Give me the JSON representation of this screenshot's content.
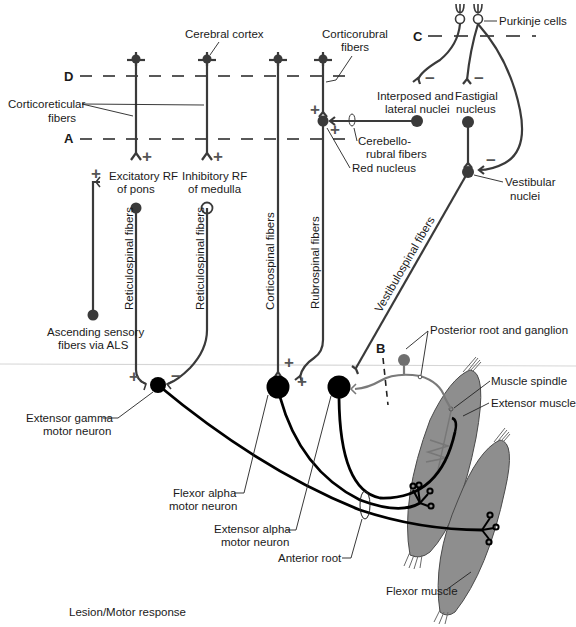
{
  "figure": {
    "colors": {
      "fiber": "#3a3a3a",
      "afferent_fiber": "#7a7a7a",
      "motor_axon": "#000000",
      "muscle_fill": "#8e8e8e",
      "ganglion_fill": "#6f6f6f",
      "divider_line": "#d6d6d6"
    },
    "lesion_levels": {
      "A": "A",
      "B": "B",
      "C": "C",
      "D": "D"
    },
    "labels": {
      "cerebral_cortex": "Cerebral cortex",
      "corticorubral_1": "Corticorubral",
      "corticorubral_2": "fibers",
      "purkinje": "Purkinje cells",
      "corticoreticular_1": "Corticoreticular",
      "corticoreticular_2": "fibers",
      "interposed_1": "Interposed and",
      "interposed_2": "lateral nuclei",
      "fastigial_1": "Fastigial",
      "fastigial_2": "nucleus",
      "cerebellorubral_1": "Cerebello-",
      "cerebellorubral_2": "rubral fibers",
      "red_nucleus": "Red nucleus",
      "excitatory_rf_1": "Excitatory RF",
      "excitatory_rf_2": "of pons",
      "inhibitory_rf_1": "Inhibitory RF",
      "inhibitory_rf_2": "of medulla",
      "vestibular_1": "Vestibular",
      "vestibular_2": "nuclei",
      "reticulospinal_1": "Reticulospinal fibers",
      "reticulospinal_2": "Reticulospinal fibers",
      "corticospinal": "Corticospinal fibers",
      "rubrospinal": "Rubrospinal fibers",
      "vestibulospinal": "Vestibulospinal fibers",
      "ascending_1": "Ascending sensory",
      "ascending_2": "fibers via ALS",
      "posterior_root": "Posterior root and ganglion",
      "muscle_spindle": "Muscle spindle",
      "extensor_muscle": "Extensor muscle",
      "ext_gamma_1": "Extensor gamma",
      "ext_gamma_2": "motor neuron",
      "flexor_alpha_1": "Flexor alpha",
      "flexor_alpha_2": "motor neuron",
      "ext_alpha_1": "Extensor alpha",
      "ext_alpha_2": "motor neuron",
      "anterior_root": "Anterior root",
      "flexor_muscle": "Flexor muscle",
      "lesion_motor_response": "Lesion/Motor response"
    },
    "signs": {
      "plus": "+",
      "minus": "−"
    }
  }
}
